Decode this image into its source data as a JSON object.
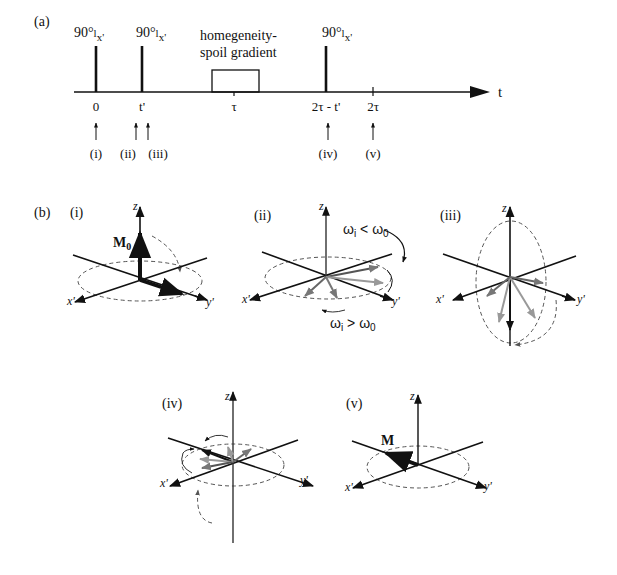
{
  "panel_a": {
    "label": "(a)",
    "axis_label": "t",
    "pulses": [
      {
        "angle": "90°",
        "sub": "x'",
        "time_label": "0"
      },
      {
        "angle": "90°",
        "sub": "x'",
        "time_label": "t'"
      },
      {
        "angle": "90°",
        "sub": "x'",
        "time_label": "2τ - t'"
      }
    ],
    "gradient": {
      "line1": "homegeneity-",
      "line2": "spoil gradient",
      "time_label": "τ"
    },
    "end_tick_label": "2τ",
    "markers": [
      "(i)",
      "(ii)",
      "(iii)",
      "(iv)",
      "(v)"
    ]
  },
  "panel_b": {
    "label": "(b)",
    "axes": {
      "z": "z",
      "x": "x'",
      "y": "y'"
    },
    "diagrams": [
      {
        "id": "i",
        "label": "(i)",
        "vector_label": "M",
        "vector_sub": "0"
      },
      {
        "id": "ii",
        "label": "(ii)",
        "slow_label": "ω",
        "slow_sub": "i",
        "slow_rel": " < ω",
        "slow_rel_sub": "0",
        "fast_label": "ω",
        "fast_sub": "i",
        "fast_rel": " > ω",
        "fast_rel_sub": "0"
      },
      {
        "id": "iii",
        "label": "(iii)"
      },
      {
        "id": "iv",
        "label": "(iv)"
      },
      {
        "id": "v",
        "label": "(v)",
        "vector_label": "M"
      }
    ]
  }
}
